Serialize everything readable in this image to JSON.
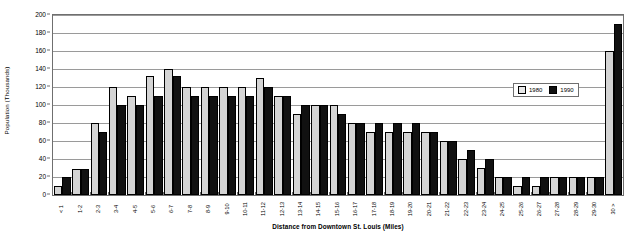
{
  "chart_data": {
    "type": "bar",
    "title": "",
    "xlabel": "Distance from Downtown St. Louis (Miles)",
    "ylabel": "Population (Thousands)",
    "ylim": [
      0,
      200
    ],
    "yticks": [
      0,
      20,
      40,
      60,
      80,
      100,
      120,
      140,
      160,
      180,
      200
    ],
    "grid": true,
    "legend_position": "upper-right-inside",
    "categories": [
      "< 1",
      "1--2",
      "2--3",
      "3--4",
      "4--5",
      "5--6",
      "6--7",
      "7--8",
      "8--9",
      "9--10",
      "10--11",
      "11--12",
      "12--13",
      "13--14",
      "14--15",
      "15--16",
      "16--17",
      "17--18",
      "18--19",
      "19--20",
      "20--21",
      "21--22",
      "22--23",
      "23--24",
      "24--25",
      "25--26",
      "26--27",
      "27--28",
      "28--29",
      "29--30",
      "30 >"
    ],
    "series": [
      {
        "name": "1980",
        "color": "#d4d4d4",
        "values": [
          10,
          29,
          80,
          120,
          110,
          132,
          140,
          120,
          120,
          120,
          120,
          130,
          110,
          90,
          100,
          100,
          80,
          70,
          70,
          70,
          70,
          60,
          40,
          30,
          20,
          10,
          10,
          20,
          20,
          20,
          160
        ]
      },
      {
        "name": "1990",
        "color": "#111111",
        "values": [
          20,
          29,
          70,
          100,
          100,
          110,
          132,
          110,
          110,
          110,
          110,
          120,
          110,
          100,
          100,
          90,
          80,
          80,
          80,
          80,
          70,
          60,
          50,
          40,
          20,
          20,
          20,
          20,
          20,
          20,
          190
        ]
      }
    ]
  },
  "legend": {
    "items": [
      {
        "label": "1980"
      },
      {
        "label": "1990"
      }
    ]
  }
}
